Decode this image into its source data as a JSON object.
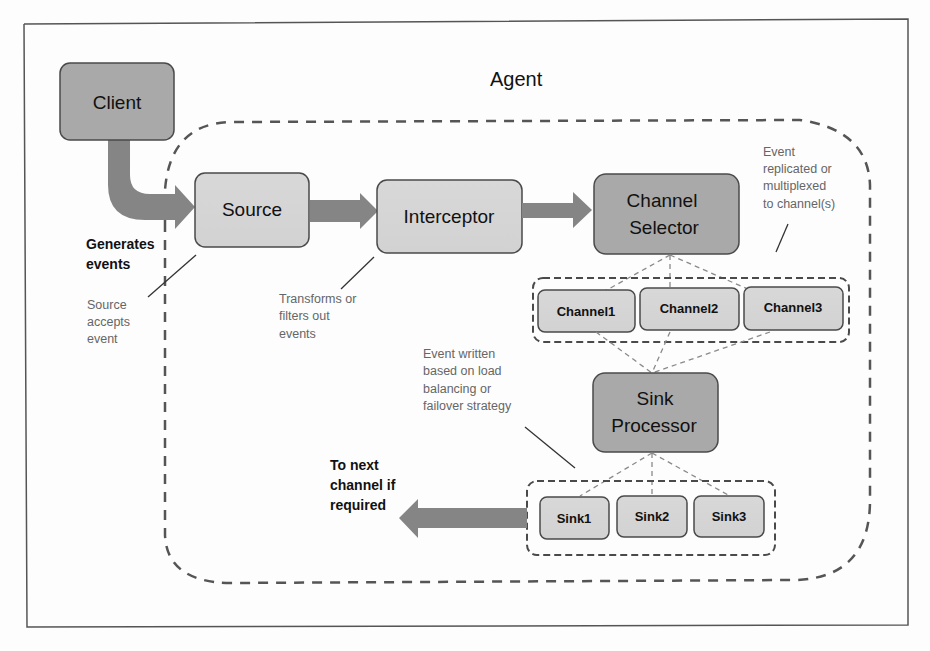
{
  "diagram": {
    "agent_label": "Agent",
    "nodes": {
      "client": "Client",
      "source": "Source",
      "interceptor": "Interceptor",
      "channel_selector": [
        "Channel",
        "Selector"
      ],
      "channels": [
        "Channel1",
        "Channel2",
        "Channel3"
      ],
      "sink_processor": [
        "Sink",
        "Processor"
      ],
      "sinks": [
        "Sink1",
        "Sink2",
        "Sink3"
      ]
    },
    "annotations": {
      "generates_events": [
        "Generates",
        "events"
      ],
      "source_accepts": [
        "Source",
        "accepts",
        "event"
      ],
      "transforms": [
        "Transforms or",
        "filters out",
        "events"
      ],
      "replicated": [
        "Event",
        "replicated or",
        "multiplexed",
        "to channel(s)"
      ],
      "event_written": [
        "Event written",
        "based on load",
        "balancing or",
        "failover strategy"
      ],
      "to_next": [
        "To next",
        "channel if",
        "required"
      ]
    },
    "colors": {
      "dark_box": "#a9a9a9",
      "light_box": "#d6d6d6",
      "arrow": "#858585",
      "stroke": "#4a4a4a",
      "dashed_connector": "#8a8a8a"
    }
  }
}
